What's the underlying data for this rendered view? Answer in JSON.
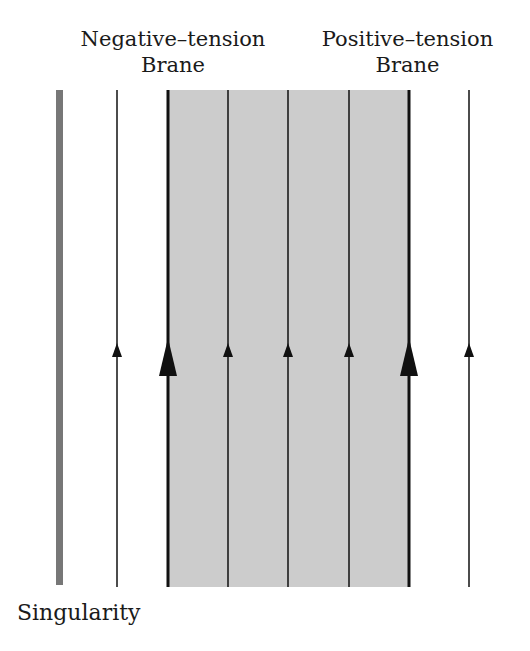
{
  "labels": {
    "negative_brane": [
      "Negative–tension",
      "Brane"
    ],
    "positive_brane": [
      "Positive–tension",
      "Brane"
    ],
    "singularity": "Singularity"
  },
  "colors": {
    "bulk_shade": "#cccccc",
    "singularity": "#777777",
    "line": "#111111"
  },
  "geometry": {
    "top_y": 90,
    "bottom_y": 587,
    "arrow_y": 352,
    "singularity_x": 59,
    "shaded_region": [
      168,
      409
    ],
    "worldlines": [
      {
        "x": 117,
        "type": "thin"
      },
      {
        "x": 168,
        "type": "brane-negative"
      },
      {
        "x": 228,
        "type": "thin"
      },
      {
        "x": 288,
        "type": "thin"
      },
      {
        "x": 349,
        "type": "thin"
      },
      {
        "x": 409,
        "type": "brane-positive"
      },
      {
        "x": 469,
        "type": "thin"
      }
    ]
  }
}
